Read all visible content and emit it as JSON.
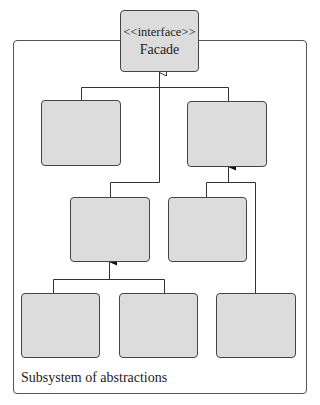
{
  "diagram": {
    "type": "UML class diagram",
    "facade": {
      "stereotype": "<<interface>>",
      "name": "Facade"
    },
    "container": {
      "label": "Subsystem of abstractions"
    },
    "boxes": [
      {
        "id": "A",
        "label": ""
      },
      {
        "id": "B",
        "label": ""
      },
      {
        "id": "C",
        "label": ""
      },
      {
        "id": "D",
        "label": ""
      },
      {
        "id": "E",
        "label": ""
      },
      {
        "id": "F",
        "label": ""
      },
      {
        "id": "G",
        "label": ""
      }
    ],
    "relations": [
      {
        "from": "A",
        "to": "Facade",
        "type": "realization (hollow arrow)"
      },
      {
        "from": "B",
        "to": "Facade",
        "type": "realization (hollow arrow)"
      },
      {
        "from": "C",
        "to": "Facade",
        "type": "realization (hollow arrow)"
      },
      {
        "from": "D",
        "to": "B",
        "type": "association (filled arrow)"
      },
      {
        "from": "G",
        "to": "B",
        "type": "association (filled arrow)"
      },
      {
        "from": "E",
        "to": "C",
        "type": "association (filled arrow)"
      },
      {
        "from": "F",
        "to": "C",
        "type": "association (filled arrow)"
      }
    ],
    "colors": {
      "box_fill": "#dcdcdc",
      "box_border": "#444444",
      "line": "#333333",
      "background": "#ffffff"
    }
  }
}
